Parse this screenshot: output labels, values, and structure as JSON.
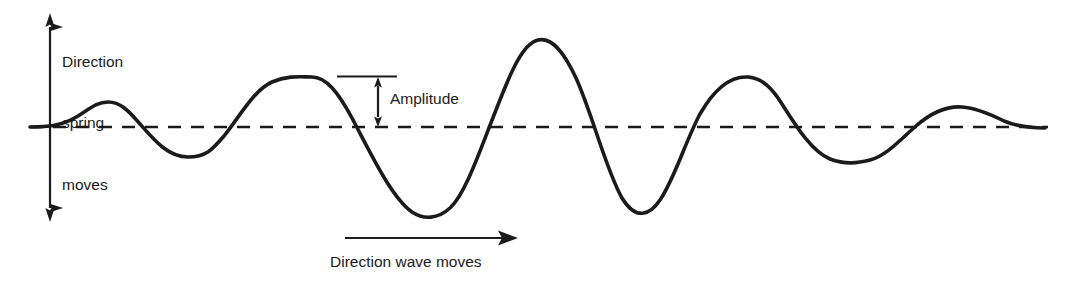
{
  "diagram": {
    "background_color": "#ffffff",
    "stroke_color": "#1b1b1b",
    "labels": {
      "spring_direction_line1": "Direction",
      "spring_direction_line2": "spring",
      "spring_direction_line3": "moves",
      "amplitude": "Amplitude",
      "wave_direction": "Direction wave moves"
    },
    "icons": {
      "spring_arrow": "double-headed-vertical-arrow",
      "amplitude_arrow": "double-headed-vertical-arrow",
      "wave_arrow": "right-arrow",
      "equilibrium": "dashed-horizontal-line"
    }
  },
  "chart_data": {
    "type": "line",
    "xlabel": "Direction wave moves",
    "ylabel": "Direction spring moves",
    "grid": false,
    "legend": null,
    "axis_y_equilibrium": 127,
    "xlim": [
      30,
      1045
    ],
    "ylim": [
      13,
      222
    ],
    "annotations": [
      {
        "name": "amplitude",
        "text": "Amplitude",
        "from_y": 77,
        "to_y": 127,
        "at_x": 378
      },
      {
        "name": "spring-motion",
        "text": "Direction spring moves",
        "at_x": 50,
        "from_y": 13,
        "to_y": 222
      },
      {
        "name": "wave-motion",
        "text": "Direction wave moves",
        "from_x": 345,
        "to_x": 515,
        "at_y": 238
      }
    ],
    "equilibrium_line": {
      "y": 127,
      "x_start": 30,
      "x_end": 1048,
      "style": "dashed"
    },
    "wave_path": "M30,127 C48,127 62,126 78,116 C92,107 98,102 108,102 C120,102 128,110 140,124 C154,140 168,157 188,157 C206,157 212,150 224,136 C240,116 254,90 272,82 C288,75 302,77 312,77 C326,77 338,92 352,118 C372,156 392,198 412,212 C424,220 438,219 450,208 C466,193 480,150 496,110 C510,74 522,44 538,40 C552,37 564,52 576,78 C592,113 606,170 622,198 C636,221 650,215 660,200 C674,180 686,140 700,114 C716,86 732,76 748,77 C762,78 772,88 782,104 C796,126 812,152 830,159 C846,165 858,163 870,160 C886,156 900,140 916,126 C932,112 948,106 962,107 C976,108 990,114 1004,121 C1018,127 1030,128 1045,128",
    "points": [
      {
        "x": 30,
        "y": 127,
        "kind": "start"
      },
      {
        "x": 108,
        "y": 102,
        "kind": "crest"
      },
      {
        "x": 188,
        "y": 157,
        "kind": "trough"
      },
      {
        "x": 312,
        "y": 77,
        "kind": "crest"
      },
      {
        "x": 430,
        "y": 215,
        "kind": "trough"
      },
      {
        "x": 538,
        "y": 40,
        "kind": "crest"
      },
      {
        "x": 648,
        "y": 212,
        "kind": "trough"
      },
      {
        "x": 763,
        "y": 78,
        "kind": "crest"
      },
      {
        "x": 873,
        "y": 160,
        "kind": "trough"
      },
      {
        "x": 968,
        "y": 107,
        "kind": "crest"
      },
      {
        "x": 1045,
        "y": 128,
        "kind": "end"
      }
    ]
  }
}
